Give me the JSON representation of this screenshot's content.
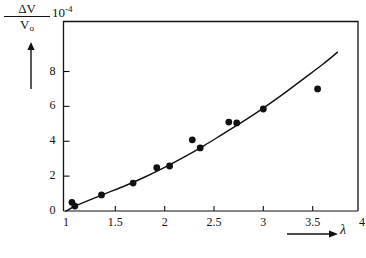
{
  "figure": {
    "background_color": "#ffffff",
    "ink_color": "#111111",
    "y_axis_numerator": "ΔV",
    "y_axis_denominator": "V",
    "y_axis_denominator_subscript": "o",
    "y_axis_scale_mantissa": "10",
    "y_axis_scale_exponent": "-4",
    "x_axis_symbol": "λ",
    "y_arrow_name": "y-axis-direction-arrow",
    "x_arrow_name": "x-axis-direction-arrow"
  },
  "chart_data": {
    "type": "scatter",
    "title": "",
    "subtitle": "",
    "xlabel": "λ",
    "ylabel": "ΔV/V₀ (×10⁻⁴)",
    "xlim": [
      1,
      4
    ],
    "ylim": [
      0,
      10
    ],
    "grid": false,
    "legend": false,
    "legend_position": "none",
    "x_ticks": [
      1,
      1.5,
      2,
      2.5,
      3,
      3.5,
      4
    ],
    "x_tick_labels": [
      "1",
      "1.5",
      "2",
      "2.5",
      "3",
      "3.5",
      "4"
    ],
    "y_ticks": [
      0,
      2,
      4,
      6,
      8
    ],
    "y_tick_labels": [
      "0",
      "2",
      "4",
      "6",
      "8"
    ],
    "series": [
      {
        "name": "measured points",
        "marker": "filled-circle",
        "color": "#111111",
        "points": [
          {
            "x": 1.06,
            "y": 0.5
          },
          {
            "x": 1.09,
            "y": 0.28
          },
          {
            "x": 1.36,
            "y": 0.92
          },
          {
            "x": 1.68,
            "y": 1.6
          },
          {
            "x": 1.92,
            "y": 2.48
          },
          {
            "x": 2.05,
            "y": 2.58
          },
          {
            "x": 2.28,
            "y": 4.08
          },
          {
            "x": 2.36,
            "y": 3.62
          },
          {
            "x": 2.65,
            "y": 5.1
          },
          {
            "x": 2.73,
            "y": 5.05
          },
          {
            "x": 3.0,
            "y": 5.85
          },
          {
            "x": 3.55,
            "y": 7.0
          }
        ]
      },
      {
        "name": "fitted curve",
        "marker": "none",
        "line": "solid",
        "color": "#111111",
        "points": [
          {
            "x": 1.0,
            "y": 0.0
          },
          {
            "x": 1.1,
            "y": 0.3
          },
          {
            "x": 1.25,
            "y": 0.65
          },
          {
            "x": 1.4,
            "y": 1.0
          },
          {
            "x": 1.6,
            "y": 1.45
          },
          {
            "x": 1.8,
            "y": 1.95
          },
          {
            "x": 2.0,
            "y": 2.5
          },
          {
            "x": 2.2,
            "y": 3.1
          },
          {
            "x": 2.4,
            "y": 3.75
          },
          {
            "x": 2.6,
            "y": 4.45
          },
          {
            "x": 2.8,
            "y": 5.15
          },
          {
            "x": 3.0,
            "y": 5.9
          },
          {
            "x": 3.2,
            "y": 6.7
          },
          {
            "x": 3.4,
            "y": 7.55
          },
          {
            "x": 3.6,
            "y": 8.4
          },
          {
            "x": 3.75,
            "y": 9.1
          }
        ]
      }
    ]
  }
}
